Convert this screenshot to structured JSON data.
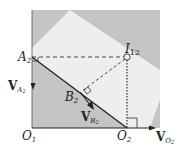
{
  "diagram": {
    "type": "kinematics-instant-center",
    "colors": {
      "background": "#ffffff",
      "dark_region": "#c4c4c4",
      "light_region": "#eeeeee",
      "line": "#222222"
    },
    "points": {
      "O1": {
        "label": "O",
        "sub": "1"
      },
      "O2": {
        "label": "O",
        "sub": "2"
      },
      "A2": {
        "label": "A",
        "sub": "2"
      },
      "B2": {
        "label": "B",
        "sub": "2"
      },
      "I12": {
        "label": "I",
        "sub": "12"
      }
    },
    "vectors": {
      "VA2": {
        "label": "V",
        "sub": "A",
        "subsub": "2"
      },
      "VB2": {
        "label": "V",
        "sub": "B",
        "subsub": "2"
      },
      "VO2": {
        "label": "V",
        "sub": "O",
        "subsub": "2"
      }
    }
  }
}
